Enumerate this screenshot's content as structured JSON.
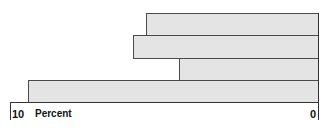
{
  "chart_data": {
    "type": "bar",
    "orientation": "horizontal",
    "direction": "right-to-left",
    "categories": [
      "Bar 1",
      "Bar 2",
      "Bar 3",
      "Bar 4"
    ],
    "values": [
      5.6,
      6.0,
      4.5,
      9.4
    ],
    "title": "",
    "xlabel": "Percent",
    "ylabel": "",
    "xlim": [
      10,
      0
    ],
    "tick_labels": [
      "10",
      "0"
    ],
    "grid": false,
    "legend": null
  },
  "axis": {
    "left_tick": "10",
    "unit_label": "Percent",
    "right_tick": "0"
  },
  "colors": {
    "bar_fill": "#e4e4e4",
    "bar_border": "#4a4a4a",
    "axis": "#333333"
  }
}
